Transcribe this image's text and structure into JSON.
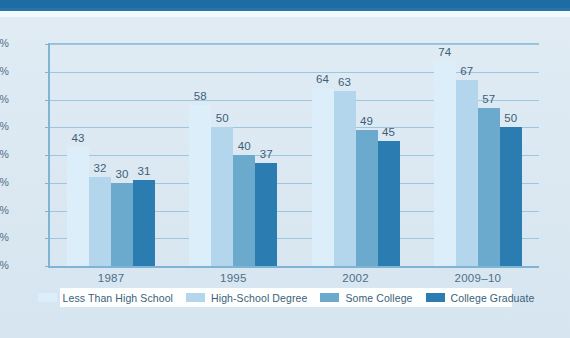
{
  "colors": {
    "top_band": "#1d6da4",
    "page_background": "#dfeaf3",
    "legend_background": "#fdfefe",
    "axis": "#7fb4d4",
    "gridline": "#9dc7e1",
    "label_text": "#3c5f78",
    "series": [
      "#dceefa",
      "#b4d6ec",
      "#6ba9cd",
      "#2b7cb0"
    ]
  },
  "chart_data": {
    "type": "bar",
    "title": "",
    "xlabel": "",
    "ylabel": "",
    "categories": [
      "1987",
      "1995",
      "2002",
      "2009–10"
    ],
    "series": [
      {
        "name": "Less Than High School",
        "color": "#dceefa",
        "values": [
          43,
          58,
          64,
          74
        ]
      },
      {
        "name": "High-School Degree",
        "color": "#b4d6ec",
        "values": [
          32,
          50,
          63,
          67
        ]
      },
      {
        "name": "Some College",
        "color": "#6ba9cd",
        "values": [
          30,
          40,
          49,
          57
        ]
      },
      {
        "name": "College Graduate",
        "color": "#2b7cb0",
        "values": [
          31,
          37,
          45,
          50
        ]
      }
    ],
    "ylim": [
      0,
      80
    ],
    "ytick_step": 10,
    "ytick_labels": [
      "0%",
      "10%",
      "20%",
      "30%",
      "40%",
      "50%",
      "60%",
      "70%",
      "80%"
    ],
    "ytick_values": [
      0,
      10,
      20,
      30,
      40,
      50,
      60,
      70,
      80
    ],
    "grid": true,
    "legend_position": "bottom",
    "data_labels": true
  }
}
